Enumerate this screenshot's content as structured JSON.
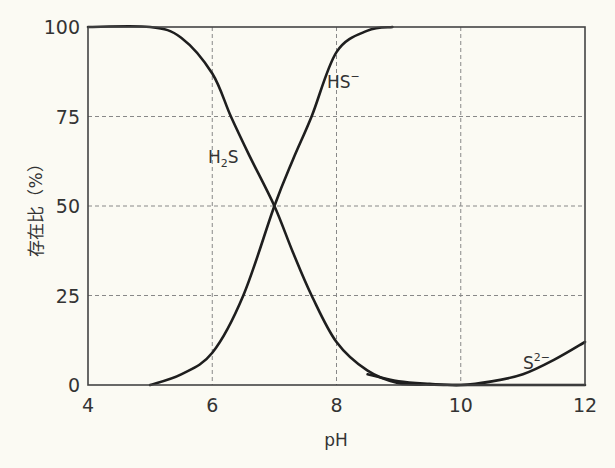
{
  "chart_data": {
    "type": "line",
    "title": "",
    "xlabel": "pH",
    "ylabel": "存在比（%）",
    "xlim": [
      4,
      12
    ],
    "ylim": [
      0,
      100
    ],
    "xticks": [
      4,
      6,
      8,
      10,
      12
    ],
    "yticks": [
      0,
      25,
      50,
      75,
      100
    ],
    "grid": true,
    "grid_style": "dashed",
    "legend": "inline labels",
    "series": [
      {
        "name": "H2S",
        "label_display": "H₂S",
        "x": [
          4,
          5,
          5.5,
          6,
          6.3,
          6.6,
          7,
          7.3,
          7.6,
          8,
          8.5,
          9,
          9.5,
          10,
          12
        ],
        "y": [
          100,
          100,
          97,
          87,
          75,
          64,
          50,
          37,
          25,
          12,
          4,
          0.5,
          0.1,
          0,
          0
        ]
      },
      {
        "name": "HS-",
        "label_display": "HS⁻",
        "x": [
          5,
          5.5,
          6,
          6.5,
          7,
          7.3,
          7.6,
          8,
          8.5,
          8.9
        ],
        "y": [
          0,
          3,
          9,
          25,
          50,
          63,
          75,
          93,
          99,
          100
        ]
      },
      {
        "name": "S2-",
        "label_display": "S²⁻",
        "x": [
          8.5,
          9,
          9.5,
          10,
          10.5,
          11,
          11.5,
          12
        ],
        "y": [
          3,
          1,
          0.3,
          0,
          1,
          3,
          7,
          12
        ]
      }
    ],
    "annotations": [
      {
        "text": "H2S",
        "x": 6.05,
        "y": 63
      },
      {
        "text": "HS-",
        "x": 7.95,
        "y": 86
      },
      {
        "text": "S2-",
        "x": 11.2,
        "y": 5
      }
    ]
  },
  "labels": {
    "xlabel": "pH",
    "ylabel": "存在比（%）",
    "h2s_main": "H",
    "h2s_sub": "2",
    "h2s_tail": "S",
    "hs_main": "HS",
    "hs_sup": "−",
    "s_main": "S",
    "s_sup": "2−"
  },
  "ticks": {
    "x": [
      "4",
      "6",
      "8",
      "10",
      "12"
    ],
    "y": [
      "0",
      "25",
      "50",
      "75",
      "100"
    ]
  }
}
